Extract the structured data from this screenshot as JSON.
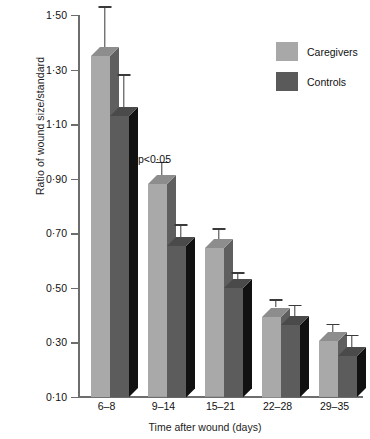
{
  "chart_data": {
    "type": "bar",
    "title": "",
    "subtitle": "",
    "xlabel": "Time after wound (days)",
    "ylabel": "Ratio of wound size/standard",
    "categories": [
      "6–8",
      "9–14",
      "15–21",
      "22–28",
      "29–35"
    ],
    "ylim": [
      0.1,
      1.5
    ],
    "yticks": [
      "0·10",
      "0·30",
      "0·50",
      "0·70",
      "0·90",
      "1·10",
      "1·30",
      "1·50"
    ],
    "ytick_values": [
      0.1,
      0.3,
      0.5,
      0.7,
      0.9,
      1.1,
      1.3,
      1.5
    ],
    "grid": false,
    "legend_position": "top-right",
    "series": [
      {
        "name": "Caregivers",
        "color": "#a8a8a8",
        "values": [
          1.35,
          0.88,
          0.645,
          0.395,
          0.305
        ],
        "errors_upper": [
          1.5,
          0.93,
          0.685,
          0.425,
          0.335
        ]
      },
      {
        "name": "Controls",
        "color": "#5a5a5a",
        "values": [
          1.13,
          0.655,
          0.5,
          0.365,
          0.25
        ],
        "errors_upper": [
          1.25,
          0.7,
          0.525,
          0.405,
          0.295
        ]
      }
    ],
    "annotations": [
      {
        "text": "p<0·05",
        "category": "9–14",
        "series": "Caregivers"
      }
    ]
  },
  "legend": {
    "items": [
      {
        "label": "Caregivers",
        "color": "#a8a8a8"
      },
      {
        "label": "Controls",
        "color": "#5a5a5a"
      }
    ]
  },
  "axes": {
    "y_title": "Ratio of wound size/standard",
    "x_title": "Time after wound (days)"
  }
}
